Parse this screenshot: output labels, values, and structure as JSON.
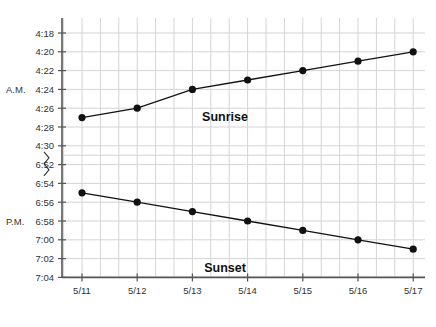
{
  "chart_data": {
    "type": "line",
    "title": "",
    "xlabel": "",
    "ylabel": "",
    "categories": [
      "5/11",
      "5/12",
      "5/13",
      "5/14",
      "5/15",
      "5/16",
      "5/17"
    ],
    "y_ticks": [
      "4:18",
      "4:20",
      "4:22",
      "4:24",
      "4:26",
      "4:28",
      "4:30",
      "6:52",
      "6:54",
      "6:56",
      "6:58",
      "7:00",
      "7:02",
      "7:04"
    ],
    "y_axis_break": "between 4:30 and 6:52",
    "y_inverted": true,
    "grid": true,
    "side_labels": [
      {
        "text": "A.M.",
        "at_tick": "4:24"
      },
      {
        "text": "P.M.",
        "at_tick": "6:58"
      }
    ],
    "series": [
      {
        "name": "Sunrise",
        "values": [
          "4:27",
          "4:26",
          "4:24",
          "4:23",
          "4:22",
          "4:21",
          "4:20"
        ],
        "minutes": [
          267,
          266,
          264,
          263,
          262,
          261,
          260
        ],
        "color": "#111111"
      },
      {
        "name": "Sunset",
        "values": [
          "6:55",
          "6:56",
          "6:57",
          "6:58",
          "6:59",
          "7:00",
          "7:01"
        ],
        "minutes": [
          415,
          416,
          417,
          418,
          419,
          420,
          421
        ],
        "color": "#111111"
      }
    ]
  },
  "colors": {
    "grid": "#d4d4d4",
    "axis": "#555555",
    "line": "#111111",
    "text": "#333333"
  }
}
